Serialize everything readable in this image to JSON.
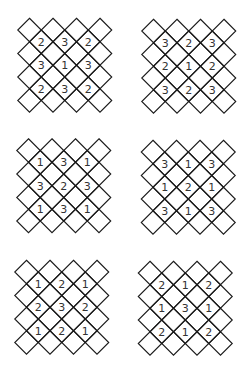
{
  "style": {
    "line_color": "#1a1a1a",
    "text_color": "#333333",
    "background": "#ffffff",
    "diamond_step": 23.5
  },
  "puzzles": [
    {
      "id": "puzzle-1",
      "position": "row1-left",
      "origin": [
        29.5,
        30
      ],
      "numbers": [
        [
          "2",
          "3",
          "2"
        ],
        [
          "3",
          "1",
          "3"
        ],
        [
          "2",
          "3",
          "2"
        ]
      ]
    },
    {
      "id": "puzzle-2",
      "position": "row1-right",
      "origin": [
        153.5,
        31
      ],
      "numbers": [
        [
          "3",
          "2",
          "3"
        ],
        [
          "2",
          "1",
          "2"
        ],
        [
          "3",
          "2",
          "3"
        ]
      ]
    },
    {
      "id": "puzzle-3",
      "position": "row2-left",
      "origin": [
        28.5,
        150.5
      ],
      "numbers": [
        [
          "1",
          "3",
          "1"
        ],
        [
          "3",
          "2",
          "3"
        ],
        [
          "1",
          "3",
          "1"
        ]
      ]
    },
    {
      "id": "puzzle-4",
      "position": "row2-right",
      "origin": [
        153,
        152
      ],
      "numbers": [
        [
          "3",
          "1",
          "3"
        ],
        [
          "1",
          "2",
          "1"
        ],
        [
          "3",
          "1",
          "3"
        ]
      ]
    },
    {
      "id": "puzzle-5",
      "position": "row3-left",
      "origin": [
        26.5,
        272
      ],
      "numbers": [
        [
          "1",
          "2",
          "1"
        ],
        [
          "2",
          "3",
          "2"
        ],
        [
          "1",
          "2",
          "1"
        ]
      ]
    },
    {
      "id": "puzzle-6",
      "position": "row3-right",
      "origin": [
        150,
        273
      ],
      "numbers": [
        [
          "2",
          "1",
          "2"
        ],
        [
          "1",
          "3",
          "1"
        ],
        [
          "2",
          "1",
          "2"
        ]
      ]
    }
  ]
}
